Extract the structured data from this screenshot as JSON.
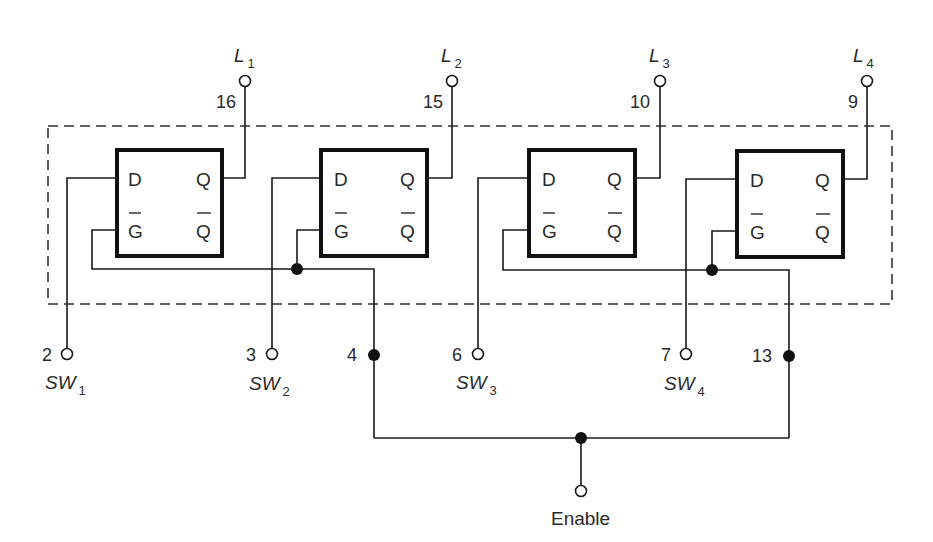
{
  "diagram": {
    "type": "circuit-schematic",
    "colors": {
      "line": "#1a1a1a",
      "background": "#ffffff"
    },
    "latches": [
      {
        "id": 1,
        "inputs": [
          "D",
          "G"
        ],
        "outputs": [
          "Q",
          "Q"
        ],
        "input_label": "SW",
        "input_sub": "1",
        "input_pin": "2",
        "output_label": "L",
        "output_sub": "1",
        "output_pin": "16"
      },
      {
        "id": 2,
        "inputs": [
          "D",
          "G"
        ],
        "outputs": [
          "Q",
          "Q"
        ],
        "input_label": "SW",
        "input_sub": "2",
        "input_pin": "3",
        "output_label": "L",
        "output_sub": "2",
        "output_pin": "15"
      },
      {
        "id": 3,
        "inputs": [
          "D",
          "G"
        ],
        "outputs": [
          "Q",
          "Q"
        ],
        "input_label": "SW",
        "input_sub": "3",
        "input_pin": "6",
        "output_label": "L",
        "output_sub": "3",
        "output_pin": "10"
      },
      {
        "id": 4,
        "inputs": [
          "D",
          "G"
        ],
        "outputs": [
          "Q",
          "Q"
        ],
        "input_label": "SW",
        "input_sub": "4",
        "input_pin": "7",
        "output_label": "L",
        "output_sub": "4",
        "output_pin": "9"
      }
    ],
    "enable_pins": {
      "left": "4",
      "right": "13"
    },
    "enable_label": "Enable",
    "overbar_signals": [
      "G",
      "Q"
    ]
  }
}
